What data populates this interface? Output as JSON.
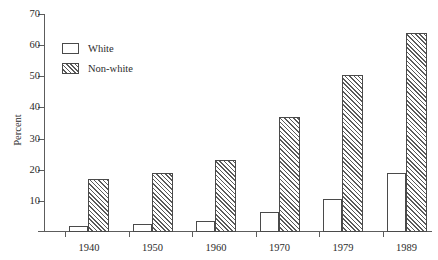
{
  "chart_data": {
    "type": "bar",
    "title": "",
    "subtitle": "",
    "xlabel": "Year",
    "ylabel": "Percent",
    "categories": [
      "1940",
      "1950",
      "1960",
      "1970",
      "1979",
      "1989"
    ],
    "series": [
      {
        "name": "White",
        "pattern": "empty",
        "values": [
          2,
          2.5,
          3.5,
          6.5,
          10.5,
          19
        ]
      },
      {
        "name": "Non-white",
        "pattern": "diagonal-hatch",
        "values": [
          17,
          19,
          23,
          37,
          50.5,
          64
        ]
      }
    ],
    "ylim": [
      0,
      70
    ],
    "y_ticks": [
      10,
      20,
      30,
      40,
      50,
      60,
      70
    ],
    "y_tick_labels": [
      "10",
      "20",
      "30",
      "40",
      "50",
      "60",
      "70"
    ],
    "grid": false,
    "legend_position": "top-left",
    "legend_entries": [
      "White",
      "Non-white"
    ],
    "annotations": []
  },
  "colors": {
    "axis": "#5c5c5c",
    "bar_outline": "#4a4a4a",
    "hatch": "#5a5a5a",
    "bar_fill": "#ffffff",
    "text": "#2b2b2b",
    "background": "#ffffff"
  }
}
